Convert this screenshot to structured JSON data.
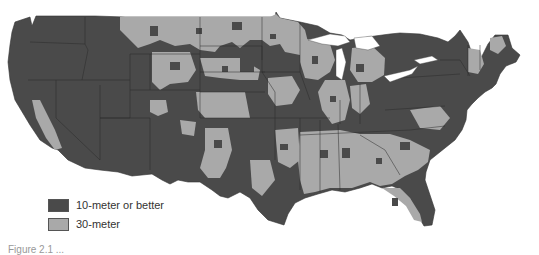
{
  "map": {
    "subject": "Contiguous United States elevation data resolution",
    "colors": {
      "ten_meter": "#4a4a4a",
      "thirty_meter": "#a9a9a9",
      "state_border": "#2a2a2a",
      "water": "#ffffff"
    }
  },
  "legend": {
    "items": [
      {
        "label": "10-meter or better",
        "color": "#4a4a4a"
      },
      {
        "label": "30-meter",
        "color": "#a9a9a9"
      }
    ]
  },
  "caption": {
    "text": "Figure 2.1 ..."
  }
}
